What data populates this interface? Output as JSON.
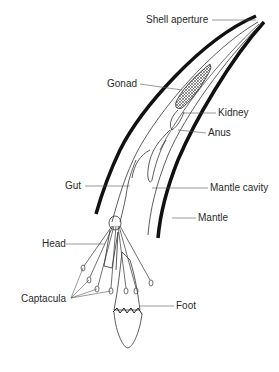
{
  "diagram": {
    "labels": {
      "shell_aperture": "Shell aperture",
      "gonad": "Gonad",
      "kidney": "Kidney",
      "anus": "Anus",
      "gut": "Gut",
      "mantle_cavity": "Mantle cavity",
      "mantle": "Mantle",
      "head": "Head",
      "captacula": "Captacula",
      "foot": "Foot"
    },
    "colors": {
      "ink": "#1a1a1a",
      "label": "#2a2a2a",
      "leader": "#555555",
      "background": "#ffffff"
    }
  }
}
